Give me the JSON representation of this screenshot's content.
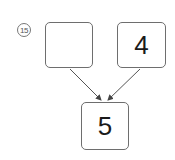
{
  "problem": {
    "number_label": "15",
    "left_box": {
      "value": ""
    },
    "right_box": {
      "value": "4"
    },
    "result_box": {
      "value": "5"
    }
  }
}
